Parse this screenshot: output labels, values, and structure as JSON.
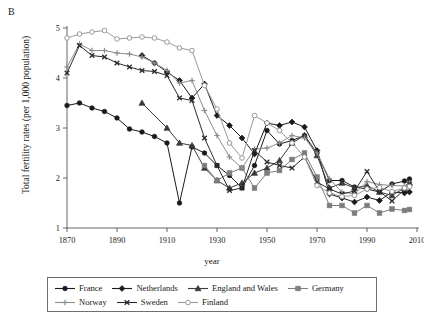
{
  "panel": {
    "label": "B"
  },
  "axes": {
    "ylabel": "Total fertility rates (per 1,000 population)",
    "xlabel": "year",
    "x_ticks": [
      "1870",
      "1890",
      "1910",
      "1930",
      "1950",
      "1970",
      "1990",
      "2010"
    ],
    "y_ticks": [
      "1",
      "2",
      "3",
      "4",
      "5"
    ]
  },
  "legend": {
    "row1": [
      {
        "name": "France",
        "marker": "filled-circle",
        "color": "#1a1a1a"
      },
      {
        "name": "Netherlands",
        "marker": "filled-diamond",
        "color": "#1a1a1a"
      },
      {
        "name": "England and Wales",
        "marker": "filled-triangle",
        "color": "#3a3a3a"
      },
      {
        "name": "Germany",
        "marker": "filled-square",
        "color": "#7d7d7d"
      }
    ],
    "row2": [
      {
        "name": "Norway",
        "marker": "plus",
        "color": "#8c8c8c"
      },
      {
        "name": "Sweden",
        "marker": "x-cross",
        "color": "#2b2b2b"
      },
      {
        "name": "Finland",
        "marker": "open-circle",
        "color": "#9a9a9a"
      }
    ]
  },
  "chart_data": {
    "type": "line",
    "title": "",
    "xlabel": "year",
    "ylabel": "Total fertility rates (per 1,000 population)",
    "xlim": [
      1870,
      2010
    ],
    "ylim": [
      1,
      5
    ],
    "grid": false,
    "legend_position": "bottom",
    "series": [
      {
        "name": "France",
        "marker": "filled-circle",
        "color": "#1a1a1a",
        "points": [
          [
            1870,
            3.45
          ],
          [
            1875,
            3.5
          ],
          [
            1880,
            3.4
          ],
          [
            1885,
            3.33
          ],
          [
            1890,
            3.2
          ],
          [
            1895,
            2.98
          ],
          [
            1900,
            2.92
          ],
          [
            1905,
            2.83
          ],
          [
            1910,
            2.7
          ],
          [
            1915,
            1.5
          ],
          [
            1920,
            2.62
          ],
          [
            1925,
            2.5
          ],
          [
            1930,
            2.25
          ],
          [
            1935,
            2.05
          ],
          [
            1940,
            1.8
          ],
          [
            1945,
            2.25
          ],
          [
            1950,
            2.95
          ],
          [
            1955,
            2.68
          ],
          [
            1960,
            2.75
          ],
          [
            1965,
            2.85
          ],
          [
            1970,
            2.5
          ],
          [
            1975,
            1.95
          ],
          [
            1980,
            1.95
          ],
          [
            1985,
            1.82
          ],
          [
            1990,
            1.78
          ],
          [
            1995,
            1.72
          ],
          [
            2000,
            1.88
          ],
          [
            2005,
            1.94
          ],
          [
            2007,
            1.98
          ]
        ]
      },
      {
        "name": "Netherlands",
        "marker": "filled-diamond",
        "color": "#1a1a1a",
        "points": [
          [
            1900,
            4.45
          ],
          [
            1905,
            4.3
          ],
          [
            1910,
            4.12
          ],
          [
            1915,
            3.95
          ],
          [
            1920,
            3.6
          ],
          [
            1925,
            3.88
          ],
          [
            1930,
            3.25
          ],
          [
            1935,
            3.05
          ],
          [
            1940,
            2.8
          ],
          [
            1945,
            2.48
          ],
          [
            1950,
            3.1
          ],
          [
            1955,
            3.05
          ],
          [
            1960,
            3.12
          ],
          [
            1965,
            3.02
          ],
          [
            1970,
            2.55
          ],
          [
            1975,
            1.68
          ],
          [
            1980,
            1.6
          ],
          [
            1985,
            1.52
          ],
          [
            1990,
            1.62
          ],
          [
            1995,
            1.55
          ],
          [
            2000,
            1.72
          ],
          [
            2005,
            1.7
          ],
          [
            2007,
            1.72
          ]
        ]
      },
      {
        "name": "England and Wales",
        "marker": "filled-triangle",
        "color": "#3a3a3a",
        "points": [
          [
            1870,
            null
          ],
          [
            1900,
            3.5
          ],
          [
            1910,
            3.0
          ],
          [
            1915,
            2.7
          ],
          [
            1920,
            2.65
          ],
          [
            1925,
            2.2
          ],
          [
            1930,
            1.95
          ],
          [
            1935,
            1.8
          ],
          [
            1940,
            1.9
          ],
          [
            1945,
            2.1
          ],
          [
            1950,
            2.2
          ],
          [
            1955,
            2.35
          ],
          [
            1960,
            2.7
          ],
          [
            1965,
            2.85
          ],
          [
            1970,
            2.45
          ],
          [
            1975,
            1.8
          ],
          [
            1980,
            1.9
          ],
          [
            1985,
            1.8
          ],
          [
            1990,
            1.85
          ],
          [
            1995,
            1.72
          ],
          [
            2000,
            1.65
          ],
          [
            2005,
            1.8
          ],
          [
            2007,
            1.9
          ]
        ]
      },
      {
        "name": "Germany",
        "marker": "filled-square",
        "color": "#7d7d7d",
        "points": [
          [
            1925,
            2.25
          ],
          [
            1930,
            1.95
          ],
          [
            1935,
            2.1
          ],
          [
            1940,
            2.2
          ],
          [
            1945,
            1.8
          ],
          [
            1950,
            2.1
          ],
          [
            1955,
            2.15
          ],
          [
            1960,
            2.37
          ],
          [
            1965,
            2.5
          ],
          [
            1970,
            2.02
          ],
          [
            1975,
            1.45
          ],
          [
            1980,
            1.45
          ],
          [
            1985,
            1.3
          ],
          [
            1990,
            1.45
          ],
          [
            1995,
            1.3
          ],
          [
            2000,
            1.38
          ],
          [
            2005,
            1.35
          ],
          [
            2007,
            1.37
          ]
        ]
      },
      {
        "name": "Norway",
        "marker": "plus",
        "color": "#8c8c8c",
        "points": [
          [
            1870,
            4.22
          ],
          [
            1875,
            4.68
          ],
          [
            1880,
            4.55
          ],
          [
            1885,
            4.55
          ],
          [
            1890,
            4.5
          ],
          [
            1895,
            4.48
          ],
          [
            1900,
            4.42
          ],
          [
            1905,
            4.3
          ],
          [
            1910,
            4.15
          ],
          [
            1915,
            3.9
          ],
          [
            1920,
            3.95
          ],
          [
            1925,
            3.35
          ],
          [
            1930,
            2.85
          ],
          [
            1935,
            2.42
          ],
          [
            1940,
            2.2
          ],
          [
            1945,
            2.58
          ],
          [
            1950,
            2.6
          ],
          [
            1955,
            2.7
          ],
          [
            1960,
            2.85
          ],
          [
            1965,
            2.8
          ],
          [
            1970,
            2.5
          ],
          [
            1975,
            1.98
          ],
          [
            1980,
            1.72
          ],
          [
            1985,
            1.68
          ],
          [
            1990,
            1.93
          ],
          [
            1995,
            1.87
          ],
          [
            2000,
            1.85
          ],
          [
            2005,
            1.84
          ],
          [
            2007,
            1.9
          ]
        ]
      },
      {
        "name": "Sweden",
        "marker": "x-cross",
        "color": "#2b2b2b",
        "points": [
          [
            1870,
            4.1
          ],
          [
            1875,
            4.65
          ],
          [
            1880,
            4.45
          ],
          [
            1885,
            4.42
          ],
          [
            1890,
            4.3
          ],
          [
            1895,
            4.22
          ],
          [
            1900,
            4.15
          ],
          [
            1905,
            4.13
          ],
          [
            1910,
            4.05
          ],
          [
            1915,
            3.6
          ],
          [
            1920,
            3.55
          ],
          [
            1925,
            2.8
          ],
          [
            1930,
            2.25
          ],
          [
            1935,
            1.75
          ],
          [
            1940,
            1.8
          ],
          [
            1945,
            2.55
          ],
          [
            1950,
            2.32
          ],
          [
            1955,
            2.25
          ],
          [
            1960,
            2.2
          ],
          [
            1965,
            2.42
          ],
          [
            1970,
            1.92
          ],
          [
            1975,
            1.78
          ],
          [
            1980,
            1.68
          ],
          [
            1985,
            1.74
          ],
          [
            1990,
            2.13
          ],
          [
            1995,
            1.73
          ],
          [
            2000,
            1.54
          ],
          [
            2005,
            1.77
          ],
          [
            2007,
            1.88
          ]
        ]
      },
      {
        "name": "Finland",
        "marker": "open-circle",
        "color": "#9a9a9a",
        "points": [
          [
            1870,
            4.8
          ],
          [
            1875,
            4.88
          ],
          [
            1880,
            4.92
          ],
          [
            1885,
            4.95
          ],
          [
            1890,
            4.78
          ],
          [
            1895,
            4.8
          ],
          [
            1900,
            4.82
          ],
          [
            1905,
            4.8
          ],
          [
            1910,
            4.72
          ],
          [
            1915,
            4.6
          ],
          [
            1920,
            4.55
          ],
          [
            1925,
            3.85
          ],
          [
            1930,
            3.38
          ],
          [
            1935,
            2.7
          ],
          [
            1940,
            2.4
          ],
          [
            1945,
            3.25
          ],
          [
            1950,
            3.1
          ],
          [
            1955,
            2.95
          ],
          [
            1960,
            2.7
          ],
          [
            1965,
            2.42
          ],
          [
            1970,
            1.85
          ],
          [
            1975,
            1.7
          ],
          [
            1980,
            1.63
          ],
          [
            1985,
            1.65
          ],
          [
            1990,
            1.78
          ],
          [
            1995,
            1.81
          ],
          [
            2000,
            1.73
          ],
          [
            2005,
            1.8
          ],
          [
            2007,
            1.83
          ]
        ]
      }
    ]
  }
}
